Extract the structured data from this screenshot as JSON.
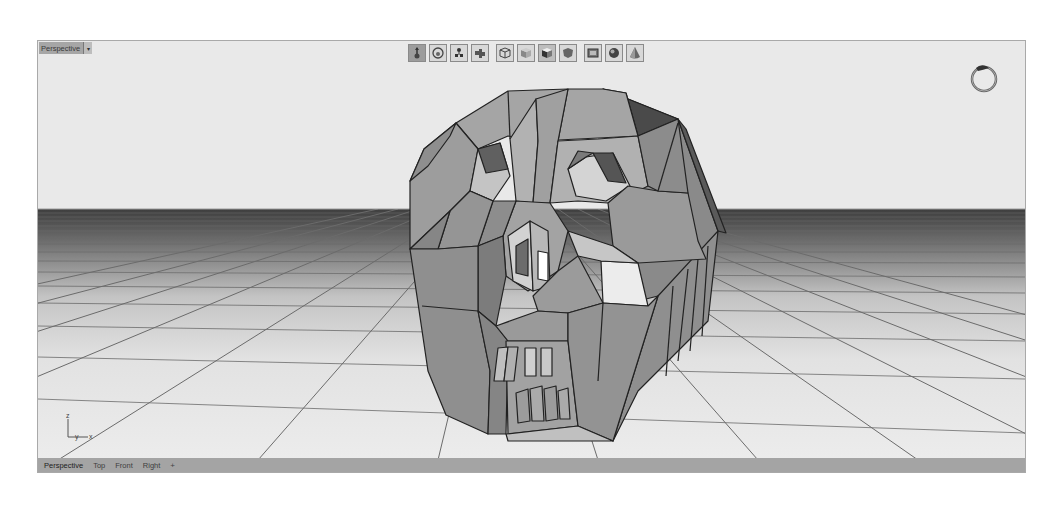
{
  "viewport": {
    "name": "Perspective",
    "menu_arrow": "▾",
    "background_color": "#e9e9e9",
    "frame_color": "#a9a9a9"
  },
  "toolbar": {
    "buttons": [
      {
        "icon": "gumball-move-icon",
        "label": "Gumball",
        "active": true
      },
      {
        "icon": "rotate-view-icon",
        "label": "Rotate View",
        "active": false
      },
      {
        "icon": "pan-object-icon",
        "label": "Pan",
        "active": false
      },
      {
        "icon": "puzzle-snap-icon",
        "label": "Snap",
        "active": false
      },
      {
        "icon": "wireframe-cube-icon",
        "label": "Wireframe",
        "active": false
      },
      {
        "icon": "shaded-cube-icon",
        "label": "Shaded",
        "active": false
      },
      {
        "icon": "rendered-cube-icon",
        "label": "Rendered",
        "active": false
      },
      {
        "icon": "ghosted-shape-icon",
        "label": "Ghosted",
        "active": false
      },
      {
        "icon": "xray-frame-icon",
        "label": "X-Ray",
        "active": false
      },
      {
        "icon": "sphere-icon",
        "label": "Sphere",
        "active": false
      },
      {
        "icon": "cone-icon",
        "label": "Cone",
        "active": false
      }
    ]
  },
  "axis": {
    "z": "z",
    "y": "y",
    "x": "x"
  },
  "tabs": [
    {
      "label": "Perspective",
      "active": true
    },
    {
      "label": "Top",
      "active": false
    },
    {
      "label": "Front",
      "active": false
    },
    {
      "label": "Right",
      "active": false
    }
  ],
  "tab_add": "+",
  "scene": {
    "object": "low-poly skull mesh",
    "horizon_y": 168
  }
}
